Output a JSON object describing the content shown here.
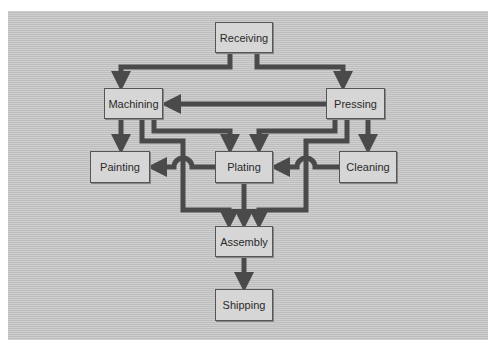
{
  "diagram": {
    "colors": {
      "background": "#c9c9c9",
      "node_fill": "#d6d6d6",
      "node_border": "#555555",
      "arrow": "#4a4a4a"
    },
    "nodes": {
      "receiving": "Receiving",
      "machining": "Machining",
      "pressing": "Pressing",
      "painting": "Painting",
      "plating": "Plating",
      "cleaning": "Cleaning",
      "assembly": "Assembly",
      "shipping": "Shipping"
    },
    "edges": [
      {
        "from": "Receiving",
        "to": "Machining"
      },
      {
        "from": "Receiving",
        "to": "Pressing"
      },
      {
        "from": "Pressing",
        "to": "Machining"
      },
      {
        "from": "Machining",
        "to": "Painting"
      },
      {
        "from": "Machining",
        "to": "Plating"
      },
      {
        "from": "Machining",
        "to": "Assembly"
      },
      {
        "from": "Pressing",
        "to": "Plating"
      },
      {
        "from": "Pressing",
        "to": "Cleaning"
      },
      {
        "from": "Pressing",
        "to": "Assembly"
      },
      {
        "from": "Plating",
        "to": "Painting"
      },
      {
        "from": "Cleaning",
        "to": "Plating"
      },
      {
        "from": "Plating",
        "to": "Assembly"
      },
      {
        "from": "Assembly",
        "to": "Shipping"
      }
    ]
  }
}
